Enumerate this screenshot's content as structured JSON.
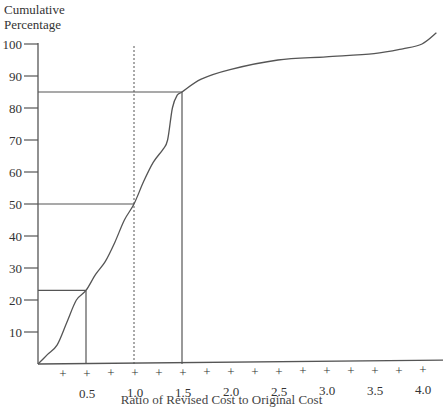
{
  "chart_data": {
    "type": "line",
    "title": "",
    "ylabel": "Cumulative Percentage",
    "xlabel": "Ratio of Revised Cost to Original Cost",
    "ylim": [
      0,
      100
    ],
    "xlim": [
      0,
      4.0
    ],
    "grid": false,
    "legend": null,
    "y_ticks": [
      10,
      20,
      30,
      40,
      50,
      60,
      70,
      80,
      90,
      100
    ],
    "y_tick_labels": [
      "10",
      "20",
      "30",
      "40",
      "50",
      "60",
      "70",
      "80",
      "90",
      "100"
    ],
    "x_ticks": [
      0.5,
      1.0,
      1.5,
      2.0,
      2.5,
      3.0,
      3.5,
      4.0
    ],
    "x_tick_labels": [
      "0.5",
      "1.0",
      "1.5",
      "2.0",
      "2.5",
      "3.0",
      "3.5",
      "4.0"
    ],
    "x_minor_ticks": [
      0.25,
      0.5,
      0.75,
      1.0,
      1.25,
      1.5,
      1.75,
      2.0,
      2.25,
      2.5,
      2.75,
      3.0,
      3.25,
      3.5,
      3.75,
      4.0
    ],
    "series": [
      {
        "name": "Cumulative distribution",
        "x": [
          0.0,
          0.1,
          0.2,
          0.3,
          0.4,
          0.5,
          0.6,
          0.7,
          0.8,
          0.9,
          1.0,
          1.1,
          1.2,
          1.3,
          1.35,
          1.4,
          1.45,
          1.5,
          1.7,
          2.0,
          2.5,
          3.0,
          3.5,
          3.8,
          4.0,
          4.15
        ],
        "y": [
          0,
          3,
          6,
          13,
          20,
          23,
          28,
          32,
          38,
          45,
          50,
          57,
          63,
          67,
          70,
          80,
          84,
          85,
          89,
          92,
          95,
          96,
          97,
          98.5,
          100,
          103.5
        ]
      }
    ],
    "reference_lines": [
      {
        "type": "horizontal",
        "y": 23,
        "x_from": 0,
        "x_to": 0.5,
        "style": "solid"
      },
      {
        "type": "vertical",
        "x": 0.5,
        "y_from": 0,
        "y_to": 23,
        "style": "solid"
      },
      {
        "type": "horizontal",
        "y": 50,
        "x_from": 0,
        "x_to": 1.0,
        "style": "solid"
      },
      {
        "type": "vertical",
        "x": 1.0,
        "y_from": 0,
        "y_to": 100,
        "style": "dotted"
      },
      {
        "type": "horizontal",
        "y": 85,
        "x_from": 0,
        "x_to": 1.5,
        "style": "solid"
      },
      {
        "type": "vertical",
        "x": 1.5,
        "y_from": 0,
        "y_to": 85,
        "style": "solid"
      }
    ]
  },
  "labels": {
    "ylabel_line1": "Cumulative",
    "ylabel_line2": "Percentage",
    "xlabel": "Ratio of Revised Cost to Original Cost"
  },
  "colors": {
    "line": "#555555",
    "text": "#333333",
    "background": "#ffffff"
  }
}
